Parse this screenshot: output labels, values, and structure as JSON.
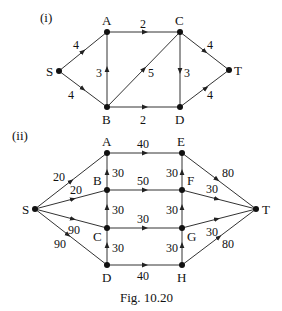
{
  "figure": {
    "caption": "Fig. 10.20",
    "part_i": {
      "label": "(i)",
      "nodes": {
        "S": "S",
        "A": "A",
        "B": "B",
        "C": "C",
        "D": "D",
        "T": "T"
      },
      "edges": [
        {
          "from": "S",
          "to": "A",
          "weight": "4"
        },
        {
          "from": "S",
          "to": "B",
          "weight": "4"
        },
        {
          "from": "A",
          "to": "C",
          "weight": "2"
        },
        {
          "from": "B",
          "to": "A",
          "weight": "3"
        },
        {
          "from": "B",
          "to": "C",
          "weight": "5"
        },
        {
          "from": "C",
          "to": "D",
          "weight": "3"
        },
        {
          "from": "B",
          "to": "D",
          "weight": "2"
        },
        {
          "from": "C",
          "to": "T",
          "weight": "4"
        },
        {
          "from": "D",
          "to": "T",
          "weight": "4"
        }
      ]
    },
    "part_ii": {
      "label": "(ii)",
      "nodes": {
        "S": "S",
        "A": "A",
        "B": "B",
        "C": "C",
        "D": "D",
        "E": "E",
        "F": "F",
        "G": "G",
        "H": "H",
        "T": "T"
      },
      "edges": [
        {
          "from": "S",
          "to": "A",
          "weight": "20"
        },
        {
          "from": "S",
          "to": "B",
          "weight": "20"
        },
        {
          "from": "S",
          "to": "C",
          "weight": "90"
        },
        {
          "from": "S",
          "to": "D",
          "weight": "90"
        },
        {
          "from": "A",
          "to": "E",
          "weight": "40"
        },
        {
          "from": "B",
          "to": "F",
          "weight": "50"
        },
        {
          "from": "C",
          "to": "G",
          "weight": "30"
        },
        {
          "from": "D",
          "to": "H",
          "weight": "40"
        },
        {
          "from": "B",
          "to": "A",
          "weight": "30"
        },
        {
          "from": "C",
          "to": "B",
          "weight": "30"
        },
        {
          "from": "D",
          "to": "C",
          "weight": "30"
        },
        {
          "from": "F",
          "to": "E",
          "weight": "30"
        },
        {
          "from": "G",
          "to": "F",
          "weight": "30"
        },
        {
          "from": "H",
          "to": "G",
          "weight": "30"
        },
        {
          "from": "E",
          "to": "T",
          "weight": "80"
        },
        {
          "from": "F",
          "to": "T",
          "weight": "30"
        },
        {
          "from": "G",
          "to": "T",
          "weight": "30"
        },
        {
          "from": "H",
          "to": "T",
          "weight": "80"
        }
      ]
    }
  }
}
